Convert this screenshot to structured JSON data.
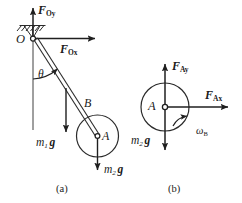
{
  "figure": {
    "title": "",
    "panels": [
      {
        "id": "a",
        "caption": "(a)",
        "labels": {
          "pivot": "O",
          "force_oy": {
            "symbol": "F",
            "sub": "Oy"
          },
          "force_ox": {
            "symbol": "F",
            "sub": "Ox"
          },
          "angle": "θ",
          "disc": "B",
          "disc_center": "A",
          "weight_rod": {
            "symbol_m": "m",
            "sub_m": "1",
            "symbol_g": "g"
          },
          "weight_disc": {
            "symbol_m": "m",
            "sub_m": "2",
            "symbol_g": "g"
          }
        }
      },
      {
        "id": "b",
        "caption": "(b)",
        "labels": {
          "center": "A",
          "force_ay": {
            "symbol": "F",
            "sub": "Ay"
          },
          "force_ax": {
            "symbol": "F",
            "sub": "Ax"
          },
          "omega": {
            "symbol": "ω",
            "sub": "B"
          },
          "weight_disc": {
            "symbol_m": "m",
            "sub_m": "2",
            "symbol_g": "g"
          }
        }
      }
    ],
    "colors": {
      "ink": "#1a1a1a",
      "stroke": "#2b2b2b",
      "background": "#ffffff"
    }
  }
}
